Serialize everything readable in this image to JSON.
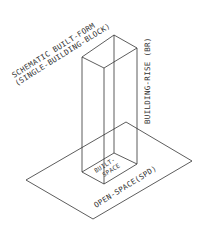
{
  "title": {
    "line1": "SCHEMATIC BUILT-FORM",
    "line2": "(SINGLE-BUILDING-BLOCK)"
  },
  "labels": {
    "building_rise": "BUILDING-RISE (BR)",
    "built_space_line1": "BUILT-",
    "built_space_line2": "SPACE",
    "open_space": "OPEN-SPACE(SPD)"
  },
  "colors": {
    "line": "#333333",
    "background": "#ffffff"
  }
}
